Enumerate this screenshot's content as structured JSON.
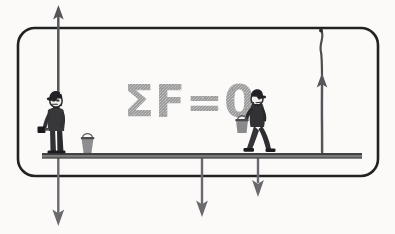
{
  "figure": {
    "equation_label": "ΣF=0",
    "background_color": "#fdfdfc",
    "ink_color": "#2b2b2b",
    "arrow_color": "#59595a",
    "equation_color": "#9b9b9b",
    "plank_color": "#7c7c7c"
  },
  "frame": {
    "name": "rounded-border",
    "x": 18,
    "y": 28,
    "width": 360,
    "height": 148,
    "corner_radius": 17,
    "stroke_width": 2.6,
    "color": "#242424"
  },
  "plank": {
    "name": "scaffold-plank",
    "x1": 42,
    "x2": 362,
    "y": 155,
    "thickness": 5,
    "color": "#6f6f6f"
  },
  "ropes": [
    {
      "name": "left-rope",
      "x": 58,
      "top_y": 10,
      "bottom_y": 158,
      "label": "left suspension rope"
    },
    {
      "name": "right-rope",
      "x": 322,
      "top_y": 32,
      "bottom_y": 155,
      "label": "right suspension rope"
    }
  ],
  "force_arrows": [
    {
      "name": "tension-arrow-left",
      "direction": "up",
      "x": 58,
      "tail_y": 96,
      "head_y": 8,
      "length": 88,
      "description": "upward tension in left rope"
    },
    {
      "name": "tension-arrow-right",
      "direction": "up",
      "x": 322,
      "tail_y": 152,
      "head_y": 75,
      "length": 77,
      "description": "upward tension in right rope"
    },
    {
      "name": "weight-arrow-left",
      "direction": "down",
      "x": 58,
      "tail_y": 158,
      "head_y": 224,
      "length": 66,
      "description": "downward weight of standing painter"
    },
    {
      "name": "weight-arrow-center",
      "direction": "down",
      "x": 202,
      "tail_y": 158,
      "head_y": 216,
      "length": 58,
      "description": "downward weight of plank"
    },
    {
      "name": "weight-arrow-right",
      "direction": "down",
      "x": 258,
      "tail_y": 155,
      "head_y": 196,
      "length": 41,
      "description": "downward weight of walking painter"
    }
  ],
  "figures": [
    {
      "name": "standing-painter",
      "x": 56,
      "y": 96,
      "description": "painter in cap standing at left holding rope and brush",
      "accessories": [
        "cap",
        "paint-brush",
        "rope-grip"
      ]
    },
    {
      "name": "walking-painter",
      "x": 252,
      "y": 92,
      "description": "painter in cap walking right carrying a paint can",
      "accessories": [
        "cap",
        "paint-can"
      ]
    }
  ],
  "props": [
    {
      "name": "paint-bucket",
      "x": 86,
      "y": 137,
      "description": "small paint bucket resting on the plank"
    }
  ]
}
